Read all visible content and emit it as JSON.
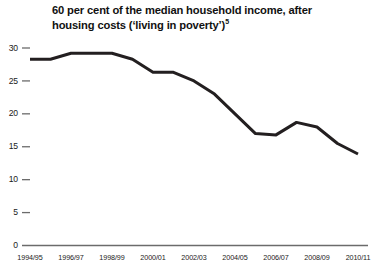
{
  "chart_data": {
    "type": "line",
    "title_line1": "60 per cent of the median household income, after",
    "title_line2": "housing costs (‘living in poverty’)",
    "title_superscript": "5",
    "xlabel": "",
    "ylabel": "",
    "ylim": [
      0,
      30
    ],
    "yticks": [
      0,
      5,
      10,
      15,
      20,
      25,
      30
    ],
    "ytick_labels": [
      "0",
      "5",
      "10",
      "15",
      "20",
      "25",
      "30"
    ],
    "grid": false,
    "legend": "none",
    "line_color": "#231f20",
    "line_width": 3,
    "x": [
      "1994/95",
      "1995/96",
      "1996/97",
      "1997/98",
      "1998/99",
      "1999/00",
      "2000/01",
      "2001/02",
      "2002/03",
      "2003/04",
      "2004/05",
      "2005/06",
      "2006/07",
      "2007/08",
      "2008/09",
      "2009/10",
      "2010/11"
    ],
    "xtick_labels": [
      "1994/95",
      "1996/97",
      "1998/99",
      "2000/01",
      "2002/03",
      "2004/05",
      "2006/07",
      "2008/09",
      "2010/11"
    ],
    "values": [
      28.3,
      28.3,
      29.2,
      29.2,
      29.2,
      28.3,
      26.3,
      26.3,
      25.0,
      23.0,
      20.0,
      17.0,
      16.8,
      18.7,
      18.0,
      15.5,
      13.9
    ],
    "series": [
      {
        "name": "60 per cent of median household income, after housing costs",
        "values": [
          28.3,
          28.3,
          29.2,
          29.2,
          29.2,
          28.3,
          26.3,
          26.3,
          25.0,
          23.0,
          20.0,
          17.0,
          16.8,
          18.7,
          18.0,
          15.5,
          13.9
        ]
      }
    ]
  },
  "colors": {
    "line": "#231f20",
    "axis": "#6b6b6b",
    "text": "#1a1a1a",
    "background": "#ffffff"
  }
}
